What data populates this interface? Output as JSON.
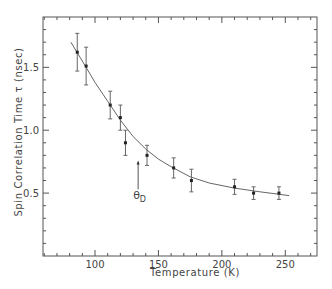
{
  "chart_data": {
    "type": "scatter",
    "title": "",
    "xlabel": "Temperature (K)",
    "ylabel": "Spin Correlation Time τ (nsec)",
    "xlim": [
      59,
      275
    ],
    "ylim": [
      0,
      1.9
    ],
    "x_ticks": [
      100,
      150,
      200,
      250
    ],
    "x_tick_labels": [
      "100",
      "150",
      "200",
      "250"
    ],
    "x_minor_step": 10,
    "y_ticks": [
      0.5,
      1.0,
      1.5
    ],
    "y_tick_labels": [
      "0.5",
      "1.0",
      "1.5"
    ],
    "y_minor_step": 0.1,
    "grid": false,
    "legend": null,
    "series": [
      {
        "name": "measured",
        "style": "points-with-error-bars",
        "x": [
          86,
          93,
          112,
          120,
          124,
          141,
          162,
          176,
          210,
          225,
          245
        ],
        "y": [
          1.62,
          1.51,
          1.2,
          1.1,
          0.9,
          0.8,
          0.7,
          0.6,
          0.55,
          0.5,
          0.5
        ],
        "yerr": [
          0.15,
          0.15,
          0.11,
          0.1,
          0.1,
          0.08,
          0.08,
          0.09,
          0.06,
          0.05,
          0.05
        ]
      },
      {
        "name": "fit",
        "style": "line",
        "x": [
          81,
          90,
          100,
          110,
          120,
          130,
          140,
          150,
          160,
          175,
          190,
          210,
          230,
          253
        ],
        "y": [
          1.7,
          1.55,
          1.38,
          1.23,
          1.08,
          0.95,
          0.85,
          0.77,
          0.71,
          0.63,
          0.58,
          0.54,
          0.51,
          0.48
        ]
      }
    ],
    "annotations": [
      {
        "text": "θD",
        "symbol": "θ",
        "subscript": "D",
        "x": 134,
        "arrow_from_y": 0.53,
        "arrow_to_y": 0.76,
        "direction": "up"
      }
    ]
  }
}
